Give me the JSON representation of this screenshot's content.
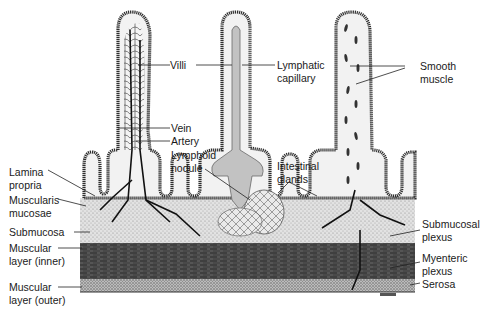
{
  "figure": {
    "colors": {
      "background": "#ffffff",
      "epithelium": "#3a3a3a",
      "lamina_fill": "#f2f2f2",
      "lymph": "#bdbdbd",
      "submucosa": "#d8d8d8",
      "inner_muscle": "#4a4a4a",
      "outer_muscle": "#a8a8a8",
      "vessels": "#111111"
    },
    "labels": {
      "villi": "Villi",
      "lymphatic_capillary_1": "Lymphatic",
      "lymphatic_capillary_2": "capillary",
      "smooth_muscle_1": "Smooth",
      "smooth_muscle_2": "muscle",
      "vein": "Vein",
      "artery": "Artery",
      "lymphoid_nodule_1": "Lymphoid",
      "lymphoid_nodule_2": "nodule",
      "intestinal_glands_1": "Intestinal",
      "intestinal_glands_2": "glands",
      "lamina_propria_1": "Lamina",
      "lamina_propria_2": "propria",
      "muscularis_mucosae_1": "Muscularis",
      "muscularis_mucosae_2": "mucosae",
      "submucosa": "Submucosa",
      "muscular_inner_1": "Muscular",
      "muscular_inner_2": "layer (inner)",
      "muscular_outer_1": "Muscular",
      "muscular_outer_2": "layer (outer)",
      "submucosal_plexus_1": "Submucosal",
      "submucosal_plexus_2": "plexus",
      "myenteric_plexus_1": "Myenteric",
      "myenteric_plexus_2": "plexus",
      "serosa": "Serosa"
    }
  }
}
